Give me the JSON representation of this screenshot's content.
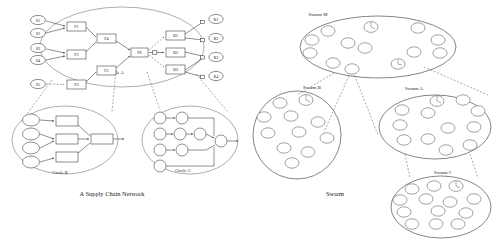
{
  "figure": {
    "left_panel": {
      "caption": "A Supply Chain Network",
      "groups": [
        {
          "id": "circle-a",
          "label": "Circle A"
        },
        {
          "id": "circle-b",
          "label": "Circle B"
        },
        {
          "id": "circle-c",
          "label": "Circle C"
        }
      ],
      "supplier_nodes": [
        {
          "id": "s1",
          "label": "S1",
          "cx": 38,
          "cy": 20,
          "rx": 7.5,
          "ry": 4.6
        },
        {
          "id": "s2",
          "label": "S2",
          "cx": 38,
          "cy": 33,
          "rx": 7.5,
          "ry": 4.6
        },
        {
          "id": "s3",
          "label": "S3",
          "cx": 38,
          "cy": 48,
          "rx": 7.5,
          "ry": 4.6
        },
        {
          "id": "s4",
          "label": "S4",
          "cx": 38,
          "cy": 60,
          "rx": 7.5,
          "ry": 4.6
        },
        {
          "id": "s5",
          "label": "S5",
          "cx": 38,
          "cy": 84,
          "rx": 7.5,
          "ry": 4.6
        }
      ],
      "factory_nodes": [
        {
          "id": "f1",
          "label": "F1",
          "x": 67,
          "y": 22,
          "w": 19,
          "h": 9
        },
        {
          "id": "f2",
          "label": "F2",
          "x": 67,
          "y": 50,
          "w": 19,
          "h": 9
        },
        {
          "id": "f3",
          "label": "F3",
          "x": 67,
          "y": 80,
          "w": 19,
          "h": 9
        },
        {
          "id": "f4",
          "label": "F4",
          "x": 97,
          "y": 34,
          "w": 19,
          "h": 9
        },
        {
          "id": "f5",
          "label": "F5",
          "x": 97,
          "y": 66,
          "w": 19,
          "h": 9
        },
        {
          "id": "f6",
          "label": "F6",
          "x": 131,
          "y": 48,
          "w": 17,
          "h": 9
        }
      ],
      "distributor_nodes": [
        {
          "id": "d1",
          "label": "D1",
          "x": 166,
          "y": 31,
          "w": 19,
          "h": 9
        },
        {
          "id": "d2",
          "label": "D2",
          "x": 166,
          "y": 48,
          "w": 19,
          "h": 9
        },
        {
          "id": "d3",
          "label": "D3",
          "x": 166,
          "y": 65,
          "w": 19,
          "h": 9
        }
      ],
      "retailer_nodes": [
        {
          "id": "r1",
          "label": "R1",
          "cx": 216,
          "cy": 19,
          "rx": 7.2,
          "ry": 4.6
        },
        {
          "id": "r2",
          "label": "R2",
          "cx": 216,
          "cy": 38,
          "rx": 7.2,
          "ry": 4.6
        },
        {
          "id": "r3",
          "label": "R3",
          "cx": 216,
          "cy": 57,
          "rx": 7.2,
          "ry": 4.6
        },
        {
          "id": "r4",
          "label": "R4",
          "cx": 216,
          "cy": 76,
          "rx": 7.2,
          "ry": 4.6
        }
      ]
    },
    "right_panel": {
      "caption": "Swarm",
      "swarms": [
        {
          "id": "swarm-m",
          "label": "Swarm M",
          "cx": 378,
          "cy": 47,
          "rx": 78,
          "ry": 31,
          "label_x": 318,
          "label_y": 14,
          "agent_count": 13
        },
        {
          "id": "swarm-b",
          "label": "Swarm B",
          "cx": 297,
          "cy": 135,
          "rx": 44,
          "ry": 44,
          "label_x": 312,
          "label_y": 87,
          "agent_count": 11
        },
        {
          "id": "swarm-a",
          "label": "Swarm A",
          "cx": 435,
          "cy": 127,
          "rx": 56,
          "ry": 32,
          "label_x": 414,
          "label_y": 88,
          "agent_count": 12
        },
        {
          "id": "swarm-c",
          "label": "Swarm C",
          "cx": 441,
          "cy": 207,
          "rx": 50,
          "ry": 31,
          "label_x": 443,
          "label_y": 172,
          "agent_count": 13
        }
      ]
    }
  }
}
